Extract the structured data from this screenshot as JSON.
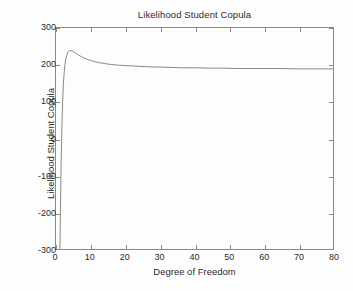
{
  "chart_data": {
    "type": "line",
    "title": "Likelihood Student Copula",
    "xlabel": "Degree of Freedom",
    "ylabel": "Likelihood Student Copula",
    "xlim": [
      0,
      80
    ],
    "ylim": [
      -300,
      300
    ],
    "xticks": [
      0,
      10,
      20,
      30,
      40,
      50,
      60,
      70,
      80
    ],
    "yticks": [
      300,
      200,
      100,
      0,
      -100,
      -200,
      -300
    ],
    "xtick_labels": [
      "0",
      "10",
      "20",
      "30",
      "40",
      "50",
      "60",
      "70",
      "80"
    ],
    "ytick_labels": [
      "300",
      "200",
      "100",
      "0",
      "-100",
      "-200",
      "-300"
    ],
    "grid": false,
    "legend": false,
    "line_color": "#6a6a6a",
    "axis_color": "#8a8a8a",
    "background_color": "#fdfdfd",
    "text_color": "#2b2b2b",
    "series": [
      {
        "name": "Likelihood Student Copula",
        "x": [
          1.0,
          1.1,
          1.2,
          1.35,
          1.5,
          1.7,
          1.9,
          2.1,
          2.3,
          2.5,
          2.8,
          3.1,
          3.4,
          3.7,
          4.0,
          4.3,
          4.6,
          5.0,
          5.5,
          6.0,
          6.5,
          7.0,
          8.0,
          9.0,
          10.0,
          11.0,
          12.0,
          13.0,
          14.0,
          15.0,
          16.0,
          18.0,
          20.0,
          22.0,
          24.0,
          26.0,
          28.0,
          30.0,
          33.0,
          36.0,
          40.0,
          44.0,
          48.0,
          52.0,
          56.0,
          60.0,
          65.0,
          70.0,
          75.0,
          80.0
        ],
        "y": [
          -420,
          -330,
          -250,
          -150,
          -60,
          30,
          95,
          140,
          172,
          194,
          214,
          226,
          233,
          237,
          239,
          239,
          238,
          236,
          233,
          230,
          227,
          224,
          219,
          215,
          212,
          209,
          207,
          205,
          204,
          202,
          201,
          199,
          198,
          197,
          196,
          195,
          194,
          194,
          193,
          192,
          192,
          191,
          191,
          190,
          190,
          190,
          190,
          189,
          189,
          189
        ]
      }
    ]
  }
}
